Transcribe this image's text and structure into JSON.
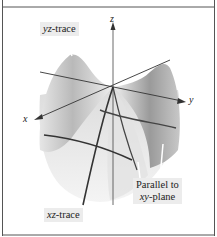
{
  "figure": {
    "axes": {
      "z": "z",
      "y": "y",
      "x": "x"
    },
    "labels": {
      "yz_trace_var": "yz",
      "yz_trace_rest": "-trace",
      "xz_trace_var": "xz",
      "xz_trace_rest": "-trace",
      "parallel_line1": "Parallel to",
      "parallel_var": "xy",
      "parallel_rest": "-plane"
    },
    "colors": {
      "frame": "#555555",
      "surface_light": "#f2f2f2",
      "surface_mid": "#cfcfcf",
      "surface_dark": "#8a8a8a",
      "trace": "#333333",
      "label_bg": "#ececec"
    }
  }
}
